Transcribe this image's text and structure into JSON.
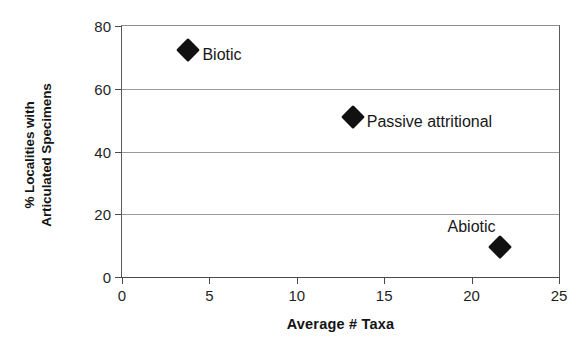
{
  "chart_data": {
    "type": "scatter",
    "title": "",
    "xlabel": "Average # Taxa",
    "ylabel": "% Localities with\nArticulated Specimens",
    "ylabel_lines": [
      "% Localities with",
      "Articulated Specimens"
    ],
    "xlim": [
      0,
      25
    ],
    "ylim": [
      0,
      80
    ],
    "xticks": [
      0,
      5,
      10,
      15,
      20,
      25
    ],
    "yticks": [
      0,
      20,
      40,
      60,
      80
    ],
    "xtick_labels": [
      "0",
      "5",
      "10",
      "15",
      "20",
      "25"
    ],
    "ytick_labels": [
      "0",
      "20",
      "40",
      "60",
      "80"
    ],
    "grid": "horizontal",
    "legend": "none",
    "marker": "filled-diamond",
    "marker_color": "#111111",
    "points": [
      {
        "label": "Biotic",
        "x": 3.8,
        "y": 72.5,
        "label_side": "right"
      },
      {
        "label": "Passive attritional",
        "x": 13.2,
        "y": 51.0,
        "label_side": "right"
      },
      {
        "label": "Abiotic",
        "x": 21.6,
        "y": 9.5,
        "label_side": "upper-left"
      }
    ]
  },
  "colors": {
    "background": "#ffffff",
    "axis": "#4a4a4a",
    "gridline": "#9b9b9b",
    "text": "#1a1a1a",
    "marker": "#111111"
  }
}
